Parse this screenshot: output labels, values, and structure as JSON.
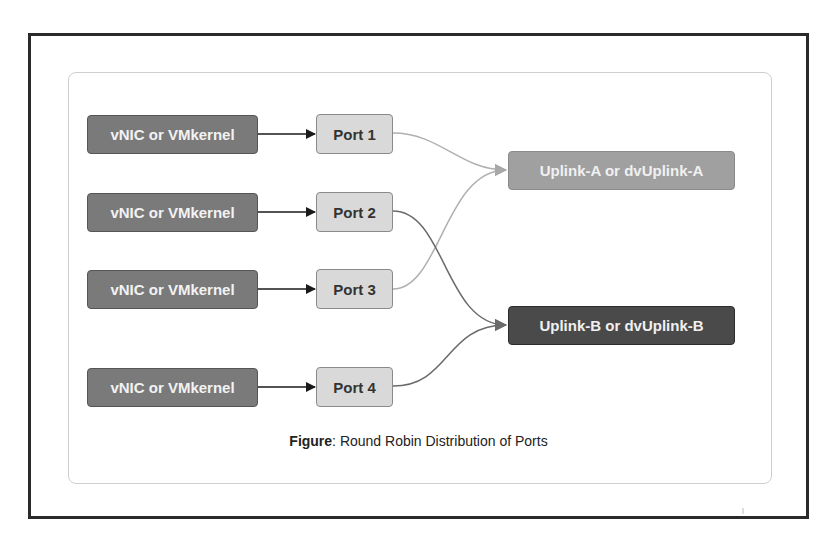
{
  "figure": {
    "caption_label": "Figure",
    "caption_text": ": Round Robin Distribution of Ports"
  },
  "sources": [
    {
      "label": "vNIC or VMkernel"
    },
    {
      "label": "vNIC or VMkernel"
    },
    {
      "label": "vNIC or VMkernel"
    },
    {
      "label": "vNIC or VMkernel"
    }
  ],
  "ports": [
    {
      "label": "Port 1",
      "uplink": "A"
    },
    {
      "label": "Port 2",
      "uplink": "B"
    },
    {
      "label": "Port 3",
      "uplink": "A"
    },
    {
      "label": "Port 4",
      "uplink": "B"
    }
  ],
  "uplinks": {
    "a": {
      "label": "Uplink-A or dvUplink-A",
      "color": "#a0a0a0"
    },
    "b": {
      "label": "Uplink-B or dvUplink-B",
      "color": "#4a4a4a"
    }
  },
  "colors": {
    "vnic": "#7a7a7a",
    "port": "#d9d9d9",
    "link_a": "#b0b0b0",
    "link_b": "#6a6a6a",
    "arrow": "#1a1a1a"
  }
}
